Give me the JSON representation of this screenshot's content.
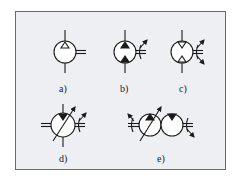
{
  "figure": {
    "background": "#eeeff3",
    "stroke": "#1a1a1a",
    "symbols": [
      {
        "id": "a",
        "label": "a)",
        "description": "fixed displacement pump, one flow direction"
      },
      {
        "id": "b",
        "label": "b)",
        "description": "fixed displacement pump, two flow directions, variable shaft"
      },
      {
        "id": "c",
        "label": "c)",
        "description": "motor, two flow directions, variable"
      },
      {
        "id": "d",
        "label": "d)",
        "description": "variable displacement pump"
      },
      {
        "id": "e",
        "label": "e)",
        "description": "hydrostatic transmission: variable pump + fixed motor"
      }
    ]
  }
}
